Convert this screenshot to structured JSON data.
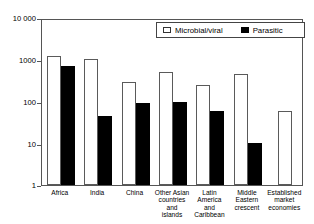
{
  "chart_data": {
    "type": "bar",
    "title": "",
    "xlabel": "",
    "ylabel": "",
    "scale": "log",
    "ylim": [
      1,
      10000
    ],
    "yticks": [
      1,
      10,
      100,
      1000,
      10000
    ],
    "ytick_labels": [
      "1",
      "10",
      "100",
      "1000",
      "10 000"
    ],
    "grid": false,
    "legend_position": "top-right",
    "categories": [
      "Africa",
      "India",
      "China",
      "Other Asian\ncountries\nand\nislands",
      "Latin\nAmerica\nand\nCaribbean",
      "Middle\nEastern\ncrescent",
      "Established\nmarket\neconomies"
    ],
    "series": [
      {
        "name": "Microbial/viral",
        "color": "#ffffff",
        "values": [
          1200,
          1050,
          300,
          500,
          250,
          450,
          60
        ]
      },
      {
        "name": "Parasitic",
        "color": "#000000",
        "values": [
          720,
          45,
          90,
          95,
          60,
          10,
          null
        ]
      }
    ]
  },
  "legend": {
    "items": [
      {
        "label": "Microbial/viral",
        "swatch": "open-square-icon"
      },
      {
        "label": "Parasitic",
        "swatch": "filled-square-icon"
      }
    ]
  }
}
